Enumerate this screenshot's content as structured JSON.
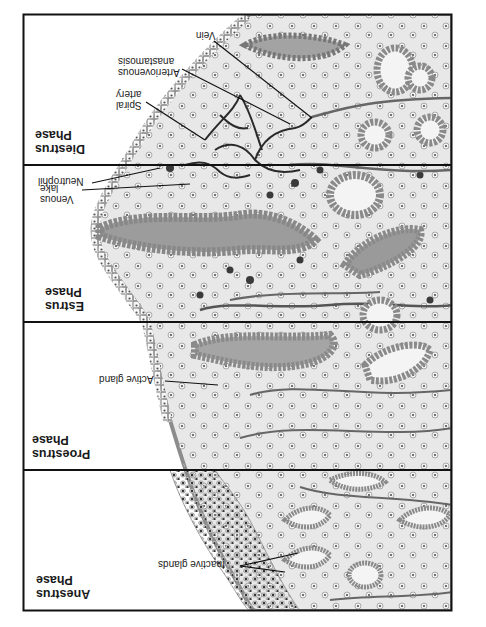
{
  "diagram": {
    "orientation": "rotated-180",
    "frame": {
      "x": 23,
      "y": 14,
      "width": 429,
      "height": 597,
      "border_color": "#111111"
    },
    "colors": {
      "stroma": "#e6e6e6",
      "epithelium": "#9a9a9a",
      "gland_lumen": "#8a8a8a",
      "vessel": "#555555",
      "spiral_artery": "#2a2a2a",
      "nucleus": "#444444",
      "background": "#ffffff"
    },
    "panels": [
      {
        "id": "diestrus",
        "title_line1": "Diestrus",
        "title_line2": "Phase",
        "y_top": 14,
        "y_bottom": 165,
        "labels": [
          {
            "text": "Vein"
          },
          {
            "text_line1": "Arteriovenous",
            "text_line2": "anastamosis"
          },
          {
            "text_line1": "Spiral",
            "text_line2": "artery"
          }
        ]
      },
      {
        "id": "estrus",
        "title_line1": "Estrus",
        "title_line2": "Phase",
        "y_top": 165,
        "y_bottom": 322,
        "labels": [
          {
            "text": "Neutrophil"
          },
          {
            "text_line1": "Venous",
            "text_line2": "lake"
          }
        ]
      },
      {
        "id": "proestrus",
        "title_line1": "Proestrus",
        "title_line2": "Phase",
        "y_top": 322,
        "y_bottom": 470,
        "labels": [
          {
            "text": "Active gland"
          }
        ]
      },
      {
        "id": "anestrus",
        "title_line1": "Anestrus",
        "title_line2": "Phase",
        "y_top": 470,
        "y_bottom": 611,
        "labels": [
          {
            "text": "Inactive glands"
          }
        ]
      }
    ]
  }
}
